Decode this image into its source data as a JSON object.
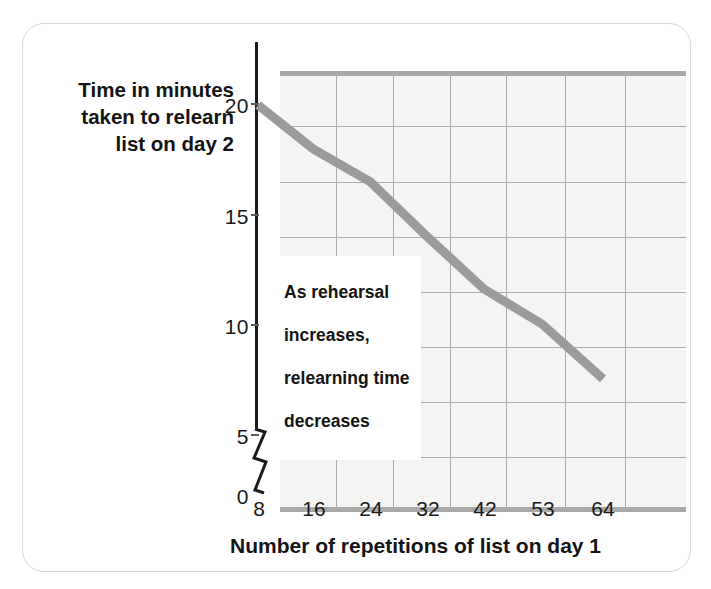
{
  "chart_data": {
    "type": "line",
    "title": "",
    "xlabel": "Number of repetitions of list on day 1",
    "ylabel": "Time in minutes taken to relearn list on day 2",
    "categories": [
      "8",
      "16",
      "24",
      "32",
      "42",
      "53",
      "64"
    ],
    "x": [
      8,
      16,
      24,
      32,
      42,
      53,
      64
    ],
    "values": [
      20,
      18,
      16.5,
      14,
      11.6,
      10,
      7.5
    ],
    "series": [
      {
        "name": "Time to relearn",
        "values": [
          20,
          18,
          16.5,
          14,
          11.6,
          10,
          7.5
        ]
      }
    ],
    "ytick_labels": [
      "20",
      "15",
      "10",
      "5",
      "0"
    ],
    "ytick_values": [
      20,
      15,
      10,
      5,
      0
    ],
    "ylim": [
      6.25,
      22.5
    ],
    "y_axis_break": true,
    "y_axis_break_between": [
      0,
      5
    ],
    "grid": true,
    "grid_step": 2.5,
    "legend_position": "none",
    "annotations": [
      {
        "text": "As rehearsal\nincreases,\nrelearning time\ndecreases",
        "x": 24,
        "y": 11.5
      }
    ],
    "line_color": "#9b9b9b",
    "grid_color": "#acacac",
    "plot_background": "#f4f4f2",
    "text_color": "#141414"
  },
  "axes": {
    "y_title": "Time in minutes\ntaken to relearn\nlist on day 2",
    "y_title_lines": [
      "Time in minutes",
      "taken to relearn",
      "list on day 2"
    ],
    "x_title": "Number of repetitions of list on day 1",
    "y_ticks": [
      {
        "label": "20",
        "value": 20
      },
      {
        "label": "15",
        "value": 15
      },
      {
        "label": "10",
        "value": 10
      },
      {
        "label": "5",
        "value": 5
      },
      {
        "label": "0",
        "value": 0
      }
    ],
    "x_ticks": [
      {
        "label": "8",
        "value": 8
      },
      {
        "label": "16",
        "value": 16
      },
      {
        "label": "24",
        "value": 24
      },
      {
        "label": "32",
        "value": 32
      },
      {
        "label": "42",
        "value": 42
      },
      {
        "label": "53",
        "value": 53
      },
      {
        "label": "64",
        "value": 64
      }
    ]
  },
  "callout": {
    "line1": "As rehearsal",
    "line2": "increases,",
    "line3": "relearning time",
    "line4": "decreases"
  },
  "icons": {
    "axis_break": "axis-break-zigzag-icon"
  }
}
